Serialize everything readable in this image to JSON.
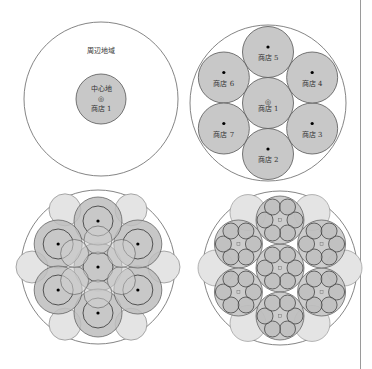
{
  "colors": {
    "stroke": "#555555",
    "fill_dark": "#c8c8c8",
    "fill_light": "#e2e2e2",
    "background": "#ffffff",
    "divider": "#9a9a9a"
  },
  "panel1": {
    "outer_label": "周辺地域",
    "center_label": "中心地",
    "marker": "◎",
    "store_label": "商店 1"
  },
  "panel2": {
    "stores": [
      {
        "label": "商店 1",
        "marker": "◎"
      },
      {
        "label": "商店 2",
        "marker": "●"
      },
      {
        "label": "商店 3",
        "marker": "●"
      },
      {
        "label": "商店 4",
        "marker": "●"
      },
      {
        "label": "商店 5",
        "marker": "●"
      },
      {
        "label": "商店 6",
        "marker": "●"
      },
      {
        "label": "商店 7",
        "marker": "●"
      }
    ]
  }
}
